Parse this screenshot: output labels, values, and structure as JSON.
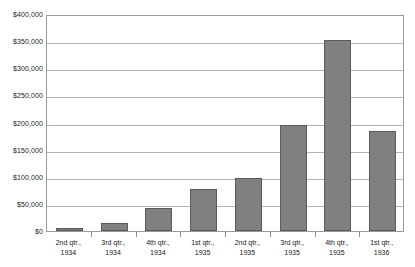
{
  "chart_data": {
    "type": "bar",
    "title": "",
    "xlabel": "",
    "ylabel": "",
    "ylim": [
      0,
      400000
    ],
    "grid": true,
    "legend": false,
    "categories": [
      "2nd qtr., 1934",
      "3rd qtr., 1934",
      "4th qtr., 1934",
      "1st qtr., 1935",
      "2nd qtr., 1935",
      "3rd qtr., 1935",
      "4th qtr., 1935",
      "1st qtr., 1936"
    ],
    "category_lines": [
      [
        "2nd qtr.,",
        "1934"
      ],
      [
        "3rd qtr.,",
        "1934"
      ],
      [
        "4th qtr.,",
        "1934"
      ],
      [
        "1st qtr.,",
        "1935"
      ],
      [
        "2nd qtr.,",
        "1935"
      ],
      [
        "3rd qtr.,",
        "1935"
      ],
      [
        "4th qtr.,",
        "1935"
      ],
      [
        "1st qtr.,",
        "1936"
      ]
    ],
    "values": [
      5000,
      14000,
      42000,
      78000,
      97000,
      196000,
      353000,
      185000
    ],
    "ytick_labels": [
      "$400,000",
      "$350,000",
      "$300,000",
      "$250,000",
      "$200,000",
      "$150,000",
      "$100,000",
      "$50,000",
      "$0"
    ],
    "ytick_values": [
      400000,
      350000,
      300000,
      250000,
      200000,
      150000,
      100000,
      50000,
      0
    ],
    "colors": {
      "bar_fill": "#808080",
      "bar_border": "#5a5a5a",
      "gridline": "#b4b4b4",
      "frame": "#9a9a9a",
      "background": "#ffffff",
      "text": "#1a1a1a"
    }
  }
}
